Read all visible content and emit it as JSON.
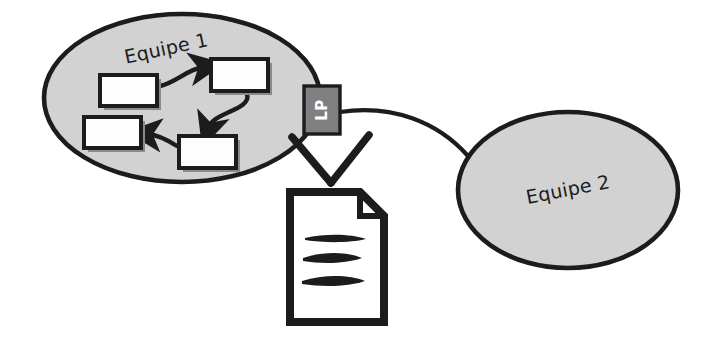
{
  "diagram": {
    "background_color": "#ffffff",
    "ink_color": "#1c1c1c",
    "ellipse_fill": "#d2d2d2",
    "box_fill": "#fdfdfd",
    "lp_fill": "#808080",
    "lp_text_color": "#ffffff",
    "shadow_color": "#808080",
    "groups": [
      {
        "id": "equipe-1",
        "label": "Equipe 1",
        "label_rotation_deg": -12,
        "shape": "ellipse",
        "cx": 182,
        "cy": 98,
        "rx": 138,
        "ry": 84
      },
      {
        "id": "equipe-2",
        "label": "Equipe 2",
        "label_rotation_deg": -11,
        "shape": "ellipse",
        "cx": 568,
        "cy": 190,
        "rx": 110,
        "ry": 78
      }
    ],
    "process_boxes": [
      {
        "id": "box-1",
        "label": "",
        "x": 100,
        "y": 75,
        "w": 57,
        "h": 31
      },
      {
        "id": "box-2",
        "label": "",
        "x": 211,
        "y": 59,
        "w": 57,
        "h": 32
      },
      {
        "id": "box-3",
        "label": "",
        "x": 84,
        "y": 117,
        "w": 57,
        "h": 31
      },
      {
        "id": "box-4",
        "label": "",
        "x": 179,
        "y": 136,
        "w": 57,
        "h": 32
      }
    ],
    "flow_arrows": [
      {
        "id": "arrow-1-to-2",
        "from": "box-1",
        "to": "box-2"
      },
      {
        "id": "arrow-2-to-4",
        "from": "box-2",
        "to": "box-4"
      },
      {
        "id": "arrow-4-to-3",
        "from": "box-4",
        "to": "box-3"
      }
    ],
    "gateway": {
      "id": "lp-gateway",
      "label": "LP",
      "text_rotation_deg": -90,
      "x": 304,
      "y": 86,
      "w": 36,
      "h": 48
    },
    "connector": {
      "id": "lp-to-equipe-2",
      "from": "lp-gateway",
      "to": "equipe-2",
      "style": "curved-line"
    },
    "chevron": {
      "id": "down-chevron",
      "direction": "down",
      "points_to": "document"
    },
    "document": {
      "id": "document",
      "label": "",
      "x": 288,
      "y": 190,
      "w": 96,
      "h": 134,
      "line_count": 3,
      "folded_corner": "top-right"
    }
  }
}
